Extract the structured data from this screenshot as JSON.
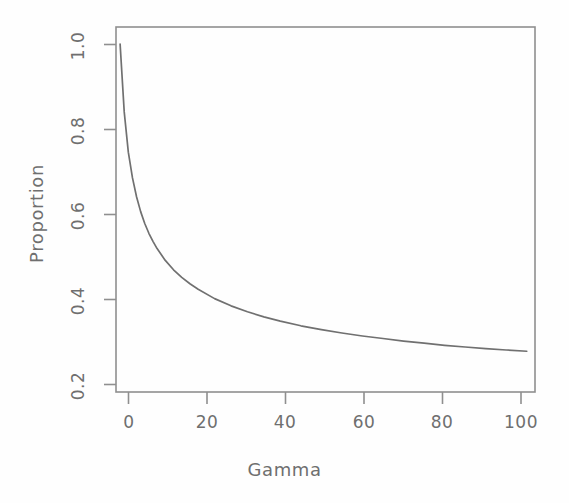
{
  "figure": {
    "background_color": "#fefefe",
    "line_color": "#707070",
    "axis_color": "#8a8a8a",
    "text_color": "#6f6f6f"
  },
  "chart_data": {
    "type": "line",
    "title": "",
    "xlabel": "Gamma",
    "ylabel": "Proportion",
    "xlim": [
      0,
      102
    ],
    "ylim": [
      0.18,
      1.04
    ],
    "grid": false,
    "legend": null,
    "x_ticks": [
      0,
      20,
      40,
      60,
      80,
      100
    ],
    "x_tick_labels": [
      "0",
      "20",
      "40",
      "60",
      "80",
      "100"
    ],
    "y_ticks": [
      0.2,
      0.4,
      0.6,
      0.8,
      1.0
    ],
    "y_tick_labels": [
      "0.2",
      "0.4",
      "0.6",
      "0.8",
      "1.0"
    ],
    "series": [
      {
        "name": "Proportion vs Gamma",
        "color": "#707070",
        "x": [
          1,
          2,
          3,
          4,
          5,
          6,
          7,
          8,
          9,
          10,
          12,
          14,
          16,
          18,
          20,
          24,
          28,
          32,
          36,
          40,
          45,
          50,
          55,
          60,
          65,
          70,
          75,
          80,
          85,
          90,
          95,
          100
        ],
        "y": [
          1.0,
          0.84,
          0.745,
          0.685,
          0.64,
          0.605,
          0.577,
          0.554,
          0.535,
          0.518,
          0.49,
          0.468,
          0.45,
          0.435,
          0.422,
          0.4,
          0.383,
          0.369,
          0.357,
          0.347,
          0.336,
          0.327,
          0.319,
          0.312,
          0.306,
          0.3,
          0.295,
          0.29,
          0.286,
          0.282,
          0.279,
          0.276
        ]
      }
    ]
  },
  "axis_labels": {
    "x_title": "Gamma",
    "y_title": "Proportion"
  }
}
